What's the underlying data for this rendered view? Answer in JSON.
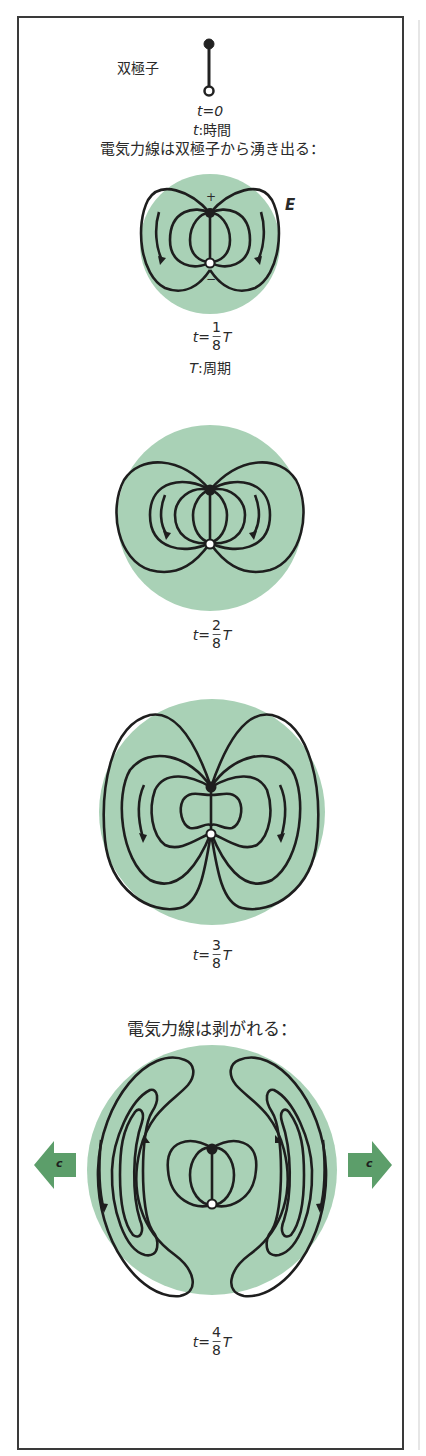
{
  "diagram": {
    "labels": {
      "dipole": "双極子",
      "t0": "t=0",
      "time_def_var": "t",
      "time_def_sep": ":",
      "time_def_word": "時間",
      "heading_emerge": "電気力線は双極子から湧き出る：",
      "plus": "+",
      "minus": "−",
      "field": "E",
      "period_def_var": "T",
      "period_def_sep": ":",
      "period_def_word": "周期",
      "heading_detach": "電気力線は剥がれる：",
      "speed_left": "c",
      "speed_right": "c"
    },
    "stages": [
      {
        "prefix": "t=",
        "num": "1",
        "den": "8",
        "suffix": "T"
      },
      {
        "prefix": "t=",
        "num": "2",
        "den": "8",
        "suffix": "T"
      },
      {
        "prefix": "t=",
        "num": "3",
        "den": "8",
        "suffix": "T"
      },
      {
        "prefix": "t=",
        "num": "4",
        "den": "8",
        "suffix": "T"
      }
    ],
    "colors": {
      "circle_fill": "#a9d1b6",
      "line": "#1e1e1e",
      "arrow_fill": "#5c9e6a",
      "frame": "#3a3a3a"
    }
  }
}
